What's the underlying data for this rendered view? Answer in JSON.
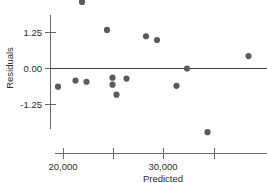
{
  "chart_data": {
    "type": "scatter",
    "title": "",
    "xlabel": "Predicted",
    "ylabel": "Residuals",
    "xlim": [
      18700,
      38000
    ],
    "ylim": [
      -2.6,
      2.6
    ],
    "grid": false,
    "legend": null,
    "x_tick_labels": [
      "20,000",
      "30,000"
    ],
    "x_tick_values": [
      20000,
      30000
    ],
    "x_minor_tick_values": [
      25000,
      35100
    ],
    "y_tick_labels": [
      "1.25",
      "0.00",
      "-1.25"
    ],
    "y_tick_values": [
      1.25,
      0.0,
      -1.25
    ],
    "reference_line": {
      "axis": "y",
      "value": 0.0
    },
    "marker": {
      "shape": "circle",
      "size": 3.1,
      "color": "#5b5b5b"
    },
    "points": [
      {
        "x": 21850,
        "y": 2.31
      },
      {
        "x": 24350,
        "y": 1.34
      },
      {
        "x": 28250,
        "y": 1.12
      },
      {
        "x": 29350,
        "y": 0.99
      },
      {
        "x": 32350,
        "y": 0.0
      },
      {
        "x": 38500,
        "y": 0.43
      },
      {
        "x": 21200,
        "y": -0.42
      },
      {
        "x": 22300,
        "y": -0.46
      },
      {
        "x": 24900,
        "y": -0.32
      },
      {
        "x": 26300,
        "y": -0.35
      },
      {
        "x": 24900,
        "y": -0.56
      },
      {
        "x": 25300,
        "y": -0.91
      },
      {
        "x": 31300,
        "y": -0.6
      },
      {
        "x": 19450,
        "y": -0.63
      },
      {
        "x": 34400,
        "y": -2.21
      }
    ]
  },
  "axes": {
    "y_axis_label": "Residuals",
    "x_axis_label": "Predicted",
    "y_ticks": [
      {
        "label": "1.25",
        "value": 1.25
      },
      {
        "label": "0.00",
        "value": 0.0
      },
      {
        "label": "-1.25",
        "value": -1.25
      }
    ],
    "x_ticks": [
      {
        "label": "20,000",
        "value": 20000
      },
      {
        "label": "30,000",
        "value": 30000
      }
    ]
  },
  "colors": {
    "marker": "#5b5b5b",
    "axis": "#6b6b6b",
    "zero_line": "#3f3f3f",
    "text": "#2b2b2b",
    "background": "#ffffff"
  }
}
